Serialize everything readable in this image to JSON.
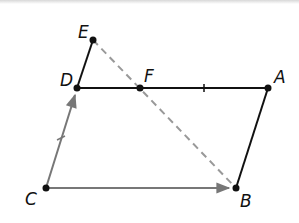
{
  "diagram": {
    "type": "geometry",
    "points": {
      "A": {
        "label": "A",
        "x": 268,
        "y": 88
      },
      "B": {
        "label": "B",
        "x": 236,
        "y": 188
      },
      "C": {
        "label": "C",
        "x": 46,
        "y": 188
      },
      "D": {
        "label": "D",
        "x": 77,
        "y": 88
      },
      "E": {
        "label": "E",
        "x": 93,
        "y": 40
      },
      "F": {
        "label": "F",
        "x": 140,
        "y": 88
      }
    },
    "segments": [
      {
        "from": "D",
        "to": "A",
        "style": "solid",
        "color": "#111111",
        "tick": "FA midpoint"
      },
      {
        "from": "A",
        "to": "B",
        "style": "solid",
        "color": "#111111"
      },
      {
        "from": "D",
        "to": "E",
        "style": "solid",
        "color": "#111111"
      },
      {
        "from": "C",
        "to": "D",
        "style": "vector",
        "color": "#777777",
        "tick": "CD midpoint"
      },
      {
        "from": "C",
        "to": "B",
        "style": "vector",
        "color": "#777777"
      },
      {
        "from": "E",
        "to": "B",
        "style": "dashed",
        "color": "#999999"
      }
    ]
  }
}
